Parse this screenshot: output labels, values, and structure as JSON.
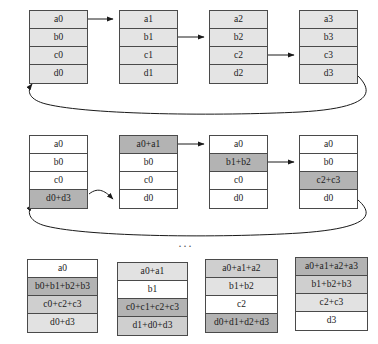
{
  "diagram": {
    "ellipsis": "...",
    "colors": {
      "border": "#4a4a4a",
      "arrow": "#1a1a1a",
      "shade_none": "#ffffff",
      "shade_light": "#e2e2e2",
      "shade_med": "#cfcfcf",
      "shade_dark": "#b3b3b3",
      "shade_top": "#e4e4e4"
    },
    "stages": [
      {
        "name": "initial-state",
        "blocks": [
          {
            "name": "node-0",
            "cells": [
              {
                "text": "a0",
                "shade": "top"
              },
              {
                "text": "b0",
                "shade": "top"
              },
              {
                "text": "c0",
                "shade": "top"
              },
              {
                "text": "d0",
                "shade": "top"
              }
            ]
          },
          {
            "name": "node-1",
            "cells": [
              {
                "text": "a1",
                "shade": "top"
              },
              {
                "text": "b1",
                "shade": "top"
              },
              {
                "text": "c1",
                "shade": "top"
              },
              {
                "text": "d1",
                "shade": "top"
              }
            ]
          },
          {
            "name": "node-2",
            "cells": [
              {
                "text": "a2",
                "shade": "top"
              },
              {
                "text": "b2",
                "shade": "top"
              },
              {
                "text": "c2",
                "shade": "top"
              },
              {
                "text": "d2",
                "shade": "top"
              }
            ]
          },
          {
            "name": "node-3",
            "cells": [
              {
                "text": "a3",
                "shade": "top"
              },
              {
                "text": "b3",
                "shade": "top"
              },
              {
                "text": "c3",
                "shade": "top"
              },
              {
                "text": "d3",
                "shade": "top"
              }
            ]
          }
        ]
      },
      {
        "name": "after-first-reduce-step",
        "blocks": [
          {
            "name": "node-0",
            "cells": [
              {
                "text": "a0",
                "shade": "none"
              },
              {
                "text": "b0",
                "shade": "none"
              },
              {
                "text": "c0",
                "shade": "none"
              },
              {
                "text": "d0+d3",
                "shade": "dark"
              }
            ]
          },
          {
            "name": "node-1",
            "cells": [
              {
                "text": "a0+a1",
                "shade": "dark"
              },
              {
                "text": "b0",
                "shade": "none"
              },
              {
                "text": "c0",
                "shade": "none"
              },
              {
                "text": "d0",
                "shade": "none"
              }
            ]
          },
          {
            "name": "node-2",
            "cells": [
              {
                "text": "a0",
                "shade": "none"
              },
              {
                "text": "b1+b2",
                "shade": "dark"
              },
              {
                "text": "c0",
                "shade": "none"
              },
              {
                "text": "d0",
                "shade": "none"
              }
            ]
          },
          {
            "name": "node-3",
            "cells": [
              {
                "text": "a0",
                "shade": "none"
              },
              {
                "text": "b0",
                "shade": "none"
              },
              {
                "text": "c2+c3",
                "shade": "dark"
              },
              {
                "text": "d0",
                "shade": "none"
              }
            ]
          }
        ]
      },
      {
        "name": "after-final-reduce-scatter",
        "blocks": [
          {
            "name": "node-0",
            "cells": [
              {
                "text": "a0",
                "shade": "none"
              },
              {
                "text": "b0+b1+b2+b3",
                "shade": "dark"
              },
              {
                "text": "c0+c2+c3",
                "shade": "med"
              },
              {
                "text": "d0+d3",
                "shade": "light"
              }
            ]
          },
          {
            "name": "node-1",
            "cells": [
              {
                "text": "a0+a1",
                "shade": "light"
              },
              {
                "text": "b1",
                "shade": "none"
              },
              {
                "text": "c0+c1+c2+c3",
                "shade": "dark"
              },
              {
                "text": "d1+d0+d3",
                "shade": "med"
              }
            ]
          },
          {
            "name": "node-2",
            "cells": [
              {
                "text": "a0+a1+a2",
                "shade": "med"
              },
              {
                "text": "b1+b2",
                "shade": "light"
              },
              {
                "text": "c2",
                "shade": "none"
              },
              {
                "text": "d0+d1+d2+d3",
                "shade": "dark"
              }
            ]
          },
          {
            "name": "node-3",
            "cells": [
              {
                "text": "a0+a1+a2+a3",
                "shade": "dark"
              },
              {
                "text": "b1+b2+b3",
                "shade": "med"
              },
              {
                "text": "c2+c3",
                "shade": "light"
              },
              {
                "text": "d3",
                "shade": "none"
              }
            ]
          }
        ]
      }
    ]
  }
}
